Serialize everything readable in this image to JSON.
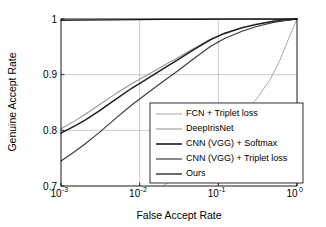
{
  "chart_data": {
    "type": "line",
    "title": "",
    "xlabel": "False Accept Rate",
    "ylabel": "Genuine Accept Rate",
    "xscale": "log",
    "xlim": [
      0.001,
      1
    ],
    "ylim": [
      0.7,
      1.0
    ],
    "grid": true,
    "legend_position": "lower right",
    "xticks": [
      {
        "value": 0.001,
        "base": "10",
        "exponent": "-3"
      },
      {
        "value": 0.01,
        "base": "10",
        "exponent": "-2"
      },
      {
        "value": 0.1,
        "base": "10",
        "exponent": "-1"
      },
      {
        "value": 1,
        "base": "10",
        "exponent": "0"
      }
    ],
    "yticks": [
      {
        "value": 0.7,
        "label": "0.7"
      },
      {
        "value": 0.8,
        "label": "0.8"
      },
      {
        "value": 0.9,
        "label": "0.9"
      },
      {
        "value": 1.0,
        "label": "1"
      }
    ],
    "series": [
      {
        "name": "FCN + Triplet loss",
        "color": "#a8a8a8",
        "width": 1.0,
        "x": [
          0.02,
          0.03,
          0.05,
          0.08,
          0.12,
          0.2,
          0.3,
          0.45,
          0.6,
          0.8,
          1.0
        ],
        "y": [
          0.7,
          0.718,
          0.745,
          0.772,
          0.796,
          0.828,
          0.855,
          0.89,
          0.925,
          0.968,
          1.0
        ]
      },
      {
        "name": "DeepIrisNet",
        "color": "#969696",
        "width": 1.1,
        "x": [
          0.001,
          0.0015,
          0.002,
          0.003,
          0.005,
          0.008,
          0.012,
          0.02,
          0.03,
          0.05,
          0.08,
          0.12,
          0.2,
          0.3,
          0.5,
          0.7,
          1.0
        ],
        "y": [
          0.803,
          0.817,
          0.828,
          0.845,
          0.866,
          0.884,
          0.898,
          0.916,
          0.93,
          0.948,
          0.964,
          0.975,
          0.985,
          0.991,
          0.996,
          0.998,
          1.0
        ]
      },
      {
        "name": "CNN (VGG) + Softmax",
        "color": "#1a1a1a",
        "width": 1.4,
        "x": [
          0.001,
          0.0015,
          0.002,
          0.003,
          0.005,
          0.008,
          0.012,
          0.02,
          0.03,
          0.05,
          0.08,
          0.12,
          0.2,
          0.3,
          0.5,
          0.7,
          1.0
        ],
        "y": [
          0.795,
          0.808,
          0.818,
          0.834,
          0.856,
          0.876,
          0.891,
          0.911,
          0.926,
          0.946,
          0.963,
          0.974,
          0.984,
          0.99,
          0.996,
          0.998,
          1.0
        ]
      },
      {
        "name": "CNN (VGG) + Triplet loss",
        "color": "#3d3d3d",
        "width": 1.2,
        "x": [
          0.001,
          0.0015,
          0.002,
          0.003,
          0.005,
          0.008,
          0.012,
          0.02,
          0.03,
          0.05,
          0.08,
          0.12,
          0.2,
          0.3,
          0.5,
          0.7,
          1.0
        ],
        "y": [
          0.745,
          0.762,
          0.775,
          0.795,
          0.822,
          0.846,
          0.865,
          0.888,
          0.906,
          0.93,
          0.951,
          0.965,
          0.978,
          0.986,
          0.994,
          0.997,
          1.0
        ]
      },
      {
        "name": "Ours",
        "color": "#2b2b2b",
        "width": 1.3,
        "x": [
          0.001,
          0.002,
          0.005,
          0.01,
          0.02,
          0.05,
          0.1,
          0.2,
          0.5,
          1.0
        ],
        "y": [
          0.9975,
          0.998,
          0.9985,
          0.999,
          0.9992,
          0.9995,
          0.9997,
          0.9998,
          0.9999,
          1.0
        ]
      }
    ]
  },
  "axes": {
    "xlabel": "False Accept Rate",
    "ylabel": "Genuine Accept Rate"
  },
  "legend": {
    "entries": [
      {
        "label": "FCN + Triplet loss",
        "color": "#a8a8a8",
        "width": 1.0
      },
      {
        "label": "DeepIrisNet",
        "color": "#969696",
        "width": 1.1
      },
      {
        "label": "CNN (VGG) + Softmax",
        "color": "#1a1a1a",
        "width": 1.6
      },
      {
        "label": "CNN (VGG) + Triplet loss",
        "color": "#3d3d3d",
        "width": 1.2
      },
      {
        "label": "Ours",
        "color": "#2b2b2b",
        "width": 1.4
      }
    ]
  }
}
